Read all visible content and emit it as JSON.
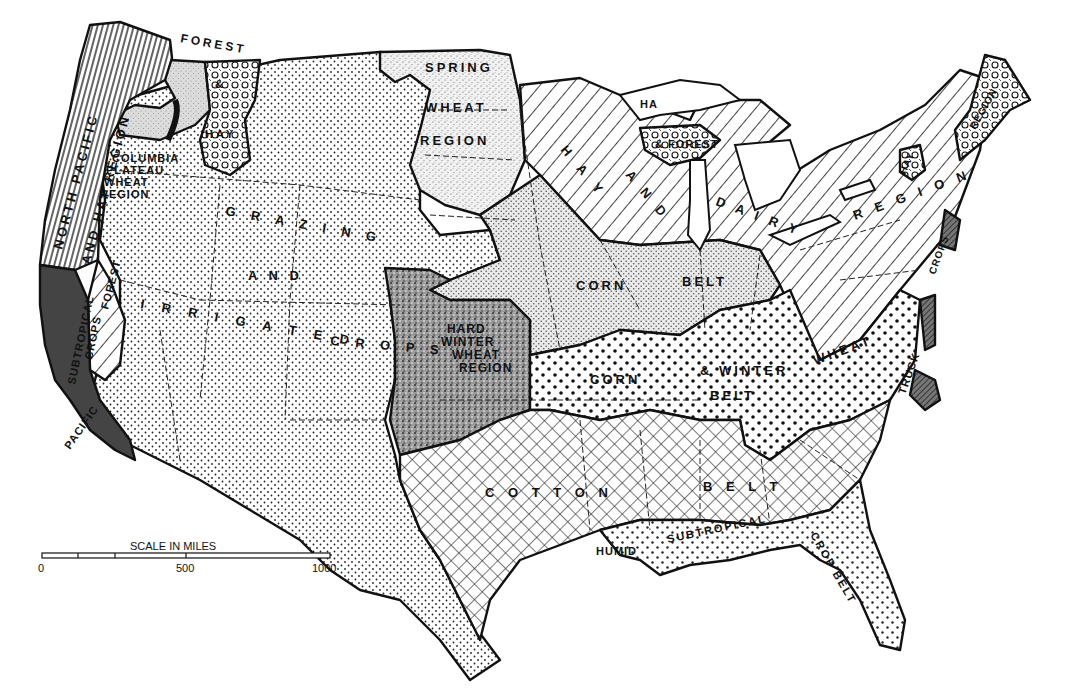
{
  "map": {
    "subject": "Agricultural regions of the United States",
    "style": "black and white patterned map",
    "regions": [
      {
        "id": "north-pacific-hay",
        "label_lines": [
          "NORTH PACIFIC",
          "HAY",
          "AND",
          "REGION"
        ],
        "pattern": "vertical-lines"
      },
      {
        "id": "columbia-plateau-wheat",
        "label_lines": [
          "COLUMBIA",
          "PLATEAU",
          "WHEAT",
          "REGION"
        ],
        "pattern": "light-gray-stipple"
      },
      {
        "id": "forest-hay-northwest",
        "label_lines": [
          "FOREST",
          "&",
          "HAY"
        ],
        "pattern": "circles"
      },
      {
        "id": "grazing-irrigated",
        "label_lines": [
          "GRAZING",
          "AND",
          "IRRIGATED",
          "CROPS"
        ],
        "pattern": "fine-dots"
      },
      {
        "id": "spring-wheat",
        "label_lines": [
          "SPRING",
          "WHEAT",
          "REGION"
        ],
        "pattern": "light-stipple"
      },
      {
        "id": "hay-dairy",
        "label_lines": [
          "HAY",
          "AND",
          "DAIRY",
          "REGION"
        ],
        "pattern": "diagonal-lines"
      },
      {
        "id": "hay-forest-great-lakes",
        "label_lines": [
          "HAY",
          "& FOREST"
        ],
        "pattern": "circles"
      },
      {
        "id": "hay-region-northeast",
        "label_lines": [
          "HAY",
          "REGION"
        ],
        "pattern": "circles"
      },
      {
        "id": "corn-belt",
        "label_lines": [
          "CORN",
          "BELT"
        ],
        "pattern": "gray-dots"
      },
      {
        "id": "hard-winter-wheat",
        "label_lines": [
          "HARD",
          "WINTER",
          "WHEAT",
          "REGION"
        ],
        "pattern": "dark-stipple"
      },
      {
        "id": "corn-winter-wheat",
        "label_lines": [
          "CORN",
          "& WINTER",
          "WHEAT",
          "BELT"
        ],
        "pattern": "large-dots"
      },
      {
        "id": "cotton-belt",
        "label_lines": [
          "COTTON",
          "BELT"
        ],
        "pattern": "crosshatch"
      },
      {
        "id": "humid-subtropical",
        "label_lines": [
          "HUMID",
          "SUBTROPICAL",
          "CROP",
          "BELT"
        ],
        "pattern": "medium-dots"
      },
      {
        "id": "pacific-subtropical",
        "label_lines": [
          "PACIFIC",
          "SUBTROPICAL",
          "CROPS"
        ],
        "pattern": "dark-fill"
      },
      {
        "id": "forest-california",
        "label_lines": [
          "FOREST"
        ],
        "pattern": "diagonal-lines"
      },
      {
        "id": "truck-crops",
        "label_lines": [
          "TRUCK",
          "CROPS"
        ],
        "pattern": "dark-hatch"
      }
    ],
    "labels": {
      "forest_top": "FOREST",
      "amp_nw": "&",
      "hay_nw": "HAY",
      "north_pacific": "NORTH PACIFIC",
      "and_hay_region": "AND HAY REGION",
      "columbia": "COLUMBIA",
      "plateau": "PLATEAU",
      "wheat_cp": "WHEAT",
      "region_cp": "REGION",
      "spring": "SPRING",
      "wheat_sw": "WHEAT",
      "region_sw": "REGION",
      "grazing": "G R A Z I N G",
      "and_gi": "A N D",
      "irrigated": "I R R I G A T E D",
      "crops_gi": "C R O P S",
      "subtropical_ca": "SUBTROPICAL",
      "crops_ca": "CROPS",
      "forest_ca": "FOREST",
      "pacific": "PACIFIC",
      "hay_gl": "HA",
      "forest_gl": "& FOREST",
      "hay_dairy_hay": "H A Y",
      "hay_dairy_and": "A N D",
      "hay_dairy_dairy": "D A I R Y",
      "region_ne": "R E G I O N",
      "hay_ne": "HAY",
      "region_ne2": "REGION",
      "crops_ne": "CROPS",
      "corn1": "CORN",
      "belt1": "BELT",
      "hard": "HARD",
      "winter": "WINTER",
      "wheat_hw": "WHEAT",
      "region_hw": "REGION",
      "corn2": "CORN",
      "winter2": "& WINTER",
      "wheat2": "WHEAT",
      "belt2": "BELT",
      "truck": "TRUCK",
      "cotton": "C O T T O N",
      "belt3": "B E L T",
      "humid": "HUMID",
      "subtropical": "SUBTROPICAL",
      "crop_belt": "CROP BELT"
    },
    "scale": {
      "title": "SCALE IN MILES",
      "ticks": [
        "0",
        "500",
        "1000"
      ],
      "max_miles": 1000
    }
  }
}
